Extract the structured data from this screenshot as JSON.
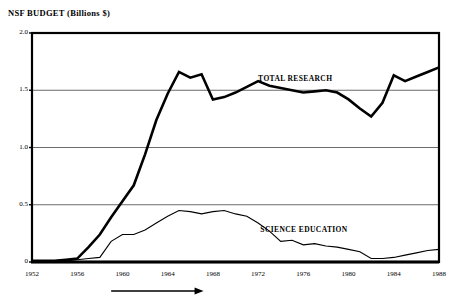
{
  "chart_data": {
    "type": "line",
    "title": "NSF BUDGET (Billions $)",
    "xlabel": "",
    "ylabel": "",
    "xlim": [
      1952,
      1988
    ],
    "ylim": [
      0,
      2.0
    ],
    "grid": true,
    "legend_position": "inline-annotation",
    "ytick_labels": [
      "2.0",
      "1.5",
      "1.0",
      "0.5",
      "0"
    ],
    "ytick_values": [
      2.0,
      1.5,
      1.0,
      0.5,
      0
    ],
    "xtick_labels": [
      "1952",
      "1956",
      "1960",
      "1964",
      "1968",
      "1972",
      "1976",
      "1980",
      "1984",
      "1988"
    ],
    "xtick_values": [
      1952,
      1956,
      1960,
      1964,
      1968,
      1972,
      1976,
      1980,
      1984,
      1988
    ],
    "x": [
      1952,
      1953,
      1954,
      1955,
      1956,
      1957,
      1958,
      1959,
      1960,
      1961,
      1962,
      1963,
      1964,
      1965,
      1966,
      1967,
      1968,
      1969,
      1970,
      1971,
      1972,
      1973,
      1974,
      1975,
      1976,
      1977,
      1978,
      1979,
      1980,
      1981,
      1982,
      1983,
      1984,
      1985,
      1986,
      1987,
      1988
    ],
    "series": [
      {
        "name": "TOTAL RESEARCH",
        "color": "#000000",
        "line_width": 2.6,
        "values": [
          0.01,
          0.01,
          0.01,
          0.02,
          0.03,
          0.13,
          0.24,
          0.39,
          0.53,
          0.67,
          0.94,
          1.24,
          1.47,
          1.66,
          1.61,
          1.64,
          1.42,
          1.44,
          1.48,
          1.53,
          1.58,
          1.54,
          1.52,
          1.5,
          1.48,
          1.49,
          1.5,
          1.48,
          1.42,
          1.34,
          1.27,
          1.39,
          1.63,
          1.58,
          1.62,
          1.66,
          1.7
        ]
      },
      {
        "name": "SCIENCE EDUCATION",
        "color": "#000000",
        "line_width": 1.1,
        "values": [
          0.01,
          0.01,
          0.01,
          0.01,
          0.02,
          0.03,
          0.04,
          0.18,
          0.24,
          0.24,
          0.28,
          0.34,
          0.4,
          0.45,
          0.44,
          0.42,
          0.44,
          0.45,
          0.42,
          0.4,
          0.34,
          0.27,
          0.18,
          0.19,
          0.15,
          0.16,
          0.14,
          0.13,
          0.11,
          0.09,
          0.03,
          0.03,
          0.04,
          0.06,
          0.08,
          0.1,
          0.11
        ]
      }
    ],
    "annotations": [
      {
        "name": "total-research-label",
        "text": "TOTAL RESEARCH",
        "x": 1972.0,
        "y": 1.6
      },
      {
        "name": "science-education-label",
        "text": "SCIENCE EDUCATION",
        "x": 1972.2,
        "y": 0.28
      },
      {
        "name": "time-span-arrow",
        "text": "",
        "x_start": 1959.0,
        "x_end": 1967.0
      }
    ]
  }
}
